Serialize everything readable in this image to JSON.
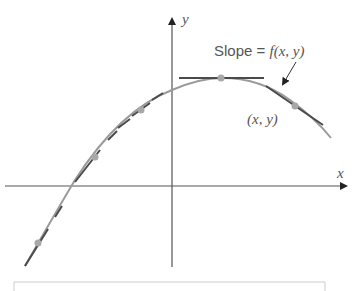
{
  "diagram": {
    "axes": {
      "x_label": "x",
      "y_label": "y"
    },
    "annotations": {
      "slope_label_prefix": "Slope = ",
      "slope_function": "f(x, y)",
      "point_label": "(x, y)"
    },
    "colors": {
      "axis": "#555555",
      "curve": "#9a9a9a",
      "tangent": "#4a4a4a",
      "dot": "#a8a8a8",
      "frame": "#cccccc"
    },
    "points": [
      {
        "x": 38,
        "y": 243
      },
      {
        "x": 95,
        "y": 157
      },
      {
        "x": 141,
        "y": 110
      },
      {
        "x": 221,
        "y": 78
      },
      {
        "x": 295,
        "y": 106
      }
    ]
  }
}
